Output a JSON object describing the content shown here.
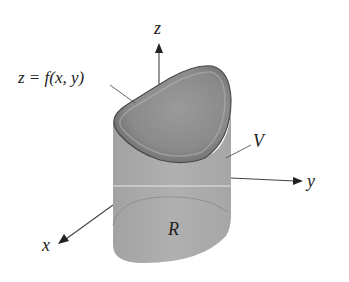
{
  "figure": {
    "labels": {
      "z_axis": "z",
      "y_axis": "y",
      "x_axis": "x",
      "surface": "z = f(x, y)",
      "volume": "V",
      "region": "R"
    },
    "colors": {
      "cylinder_side": "#a9a9a9",
      "top_surface": "#8e8e8e",
      "top_rim": "#5a5a5a",
      "axis": "#333333",
      "region_outline": "#909090",
      "background": "#ffffff"
    }
  }
}
